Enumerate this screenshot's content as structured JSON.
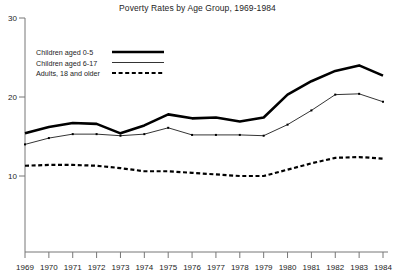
{
  "chart_data": {
    "type": "line",
    "title": "Poverty Rates by Age Group, 1969-1984",
    "xlabel": "",
    "ylabel": "",
    "xlim": [
      1969,
      1984
    ],
    "ylim": [
      0,
      30
    ],
    "yticks": [
      10,
      20,
      30
    ],
    "ytick_labels": [
      "10",
      "20",
      "30"
    ],
    "grid": false,
    "legend_position": "top-left",
    "x": [
      1969,
      1970,
      1971,
      1972,
      1973,
      1974,
      1975,
      1976,
      1977,
      1978,
      1979,
      1980,
      1981,
      1982,
      1983,
      1984
    ],
    "xtick_labels": [
      "1969",
      "1970",
      "1971",
      "1972",
      "1973",
      "1974",
      "1975",
      "1976",
      "1977",
      "1978",
      "1979",
      "1980",
      "1981",
      "1982",
      "1983",
      "1984"
    ],
    "series": [
      {
        "name": "Children aged 0-5",
        "style": "thick-solid",
        "color": "#000000",
        "values": [
          15.4,
          16.2,
          16.7,
          16.6,
          15.4,
          16.4,
          17.8,
          17.3,
          17.4,
          16.9,
          17.4,
          20.3,
          22.0,
          23.3,
          24.0,
          22.7
        ]
      },
      {
        "name": "Children aged 6-17",
        "style": "thin-solid",
        "color": "#000000",
        "values": [
          14.0,
          14.8,
          15.3,
          15.3,
          15.1,
          15.3,
          16.1,
          15.2,
          15.2,
          15.2,
          15.1,
          16.5,
          18.3,
          20.3,
          20.4,
          19.4
        ]
      },
      {
        "name": "Adults, 18 and older",
        "style": "dashed",
        "color": "#000000",
        "values": [
          11.3,
          11.4,
          11.4,
          11.3,
          11.0,
          10.6,
          10.6,
          10.4,
          10.2,
          10.0,
          10.0,
          10.8,
          11.6,
          12.3,
          12.4,
          12.2
        ]
      }
    ]
  },
  "legend": {
    "items": [
      {
        "label": "Children aged 0-5"
      },
      {
        "label": "Children aged 6-17"
      },
      {
        "label": "Adults, 18 and older"
      }
    ]
  }
}
